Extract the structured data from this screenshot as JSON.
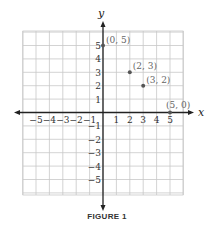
{
  "chart_data": {
    "type": "scatter",
    "title": "",
    "caption": "FIGURE 1",
    "xlabel": "x",
    "ylabel": "y",
    "xlim": [
      -6,
      6
    ],
    "ylim": [
      -6,
      6
    ],
    "grid": true,
    "x_ticks": [
      -5,
      -4,
      -3,
      -2,
      -1,
      1,
      2,
      3,
      4,
      5
    ],
    "y_ticks": [
      5,
      4,
      3,
      2,
      1,
      -1,
      -2,
      -3,
      -4,
      -5
    ],
    "points": [
      {
        "x": 0,
        "y": 5,
        "label": "(0, 5)"
      },
      {
        "x": 2,
        "y": 3,
        "label": "(2, 3)"
      },
      {
        "x": 3,
        "y": 2,
        "label": "(3, 2)"
      },
      {
        "x": 5,
        "y": 0,
        "label": "(5, 0)"
      }
    ]
  },
  "colors": {
    "grid": "#c8c8c8",
    "axis": "#222222",
    "point": "#555555"
  }
}
